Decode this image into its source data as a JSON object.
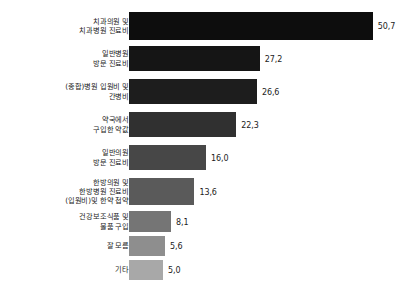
{
  "chart_data": {
    "type": "bar",
    "orientation": "horizontal",
    "title": "",
    "subtitle": "",
    "xlabel": "",
    "ylabel": "",
    "grid": false,
    "legend": false,
    "axis_visible": false,
    "decimal_separator": ",",
    "xlim": [
      0,
      50.7
    ],
    "categories": [
      "치과의원 및\n치과병원 진료비",
      "일반병원\n방문 진료비",
      "(종합)병원 입원비 및\n간병비",
      "약국에서\n구입한 약값",
      "일반의원\n방문 진료비",
      "한방의원 및\n한방병원 진료비\n(입원비)및 한약 첩약",
      "건강보조식품 및\n물품 구입",
      "잘 모름",
      "기타"
    ],
    "values": [
      50.7,
      27.2,
      26.6,
      22.3,
      16.0,
      13.6,
      8.1,
      5.6,
      5.0
    ],
    "value_labels": [
      "50,7",
      "27,2",
      "26,6",
      "22,3",
      "16,0",
      "13,6",
      "8,1",
      "5,6",
      "5,0"
    ],
    "bar_colors": [
      "#0d0d0d",
      "#151515",
      "#1d1d1d",
      "#303030",
      "#474747",
      "#5a5a5a",
      "#757575",
      "#8e8e8e",
      "#a8a8a8"
    ]
  }
}
